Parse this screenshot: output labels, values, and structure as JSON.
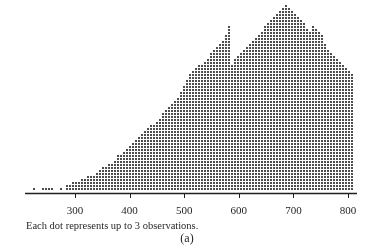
{
  "chart_data": {
    "type": "dotplot",
    "title": "",
    "xlabel": "",
    "ylabel": "",
    "note": "Each dot represents up to 3 observations.",
    "caption": "(a)",
    "x_ticks": [
      300,
      400,
      500,
      600,
      700,
      800
    ],
    "xlim": [
      215,
      820
    ],
    "dot_color": "#4d4d4d",
    "axis_color": "#231f20",
    "dots_per_symbol": 3,
    "column_width_units": 5.5,
    "columns_start": 225,
    "column_heights": [
      1,
      0,
      0,
      1,
      1,
      1,
      1,
      0,
      0,
      1,
      0,
      2,
      2,
      3,
      3,
      3,
      4,
      4,
      5,
      5,
      5,
      6,
      7,
      8,
      8,
      9,
      9,
      10,
      12,
      12,
      13,
      14,
      15,
      16,
      17,
      18,
      19,
      20,
      21,
      22,
      22,
      23,
      24,
      26,
      27,
      28,
      29,
      30,
      31,
      33,
      35,
      37,
      39,
      40,
      41,
      42,
      42,
      43,
      44,
      46,
      47,
      48,
      49,
      50,
      52,
      55,
      42,
      44,
      45,
      46,
      47,
      48,
      49,
      50,
      51,
      52,
      53,
      55,
      56,
      57,
      58,
      59,
      60,
      61,
      62,
      61,
      60,
      59,
      58,
      57,
      56,
      54,
      53,
      55,
      54,
      53,
      52,
      49,
      47,
      46,
      45,
      44,
      43,
      42,
      41,
      40,
      39,
      38,
      37,
      36,
      35,
      34,
      33,
      31,
      30,
      29,
      28,
      27,
      25,
      24,
      23,
      22,
      21,
      20,
      19,
      18,
      17,
      16,
      15,
      14,
      14,
      13,
      12,
      11,
      10,
      9,
      9,
      8,
      7,
      6,
      5,
      5,
      4,
      3,
      3,
      2,
      2,
      2,
      1,
      1,
      1,
      1,
      1,
      1,
      0,
      1,
      2,
      1,
      1,
      1,
      0,
      0,
      0,
      1,
      0,
      1
    ]
  }
}
